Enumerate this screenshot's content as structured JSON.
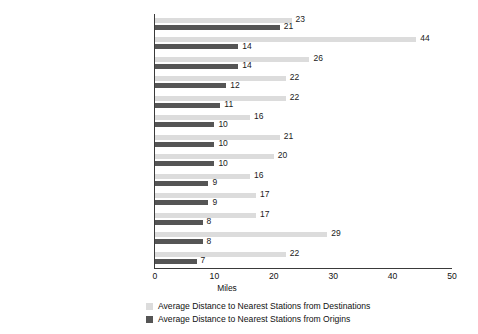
{
  "chart_data": {
    "type": "bar",
    "orientation": "horizontal",
    "title": "",
    "xlabel": "Miles",
    "ylabel": "",
    "xlim": [
      0,
      50
    ],
    "xticks": [
      0,
      10,
      20,
      30,
      40,
      50
    ],
    "grid": false,
    "legend_position": "bottom-left",
    "categories": [
      "Medical",
      "Outdoor recreation",
      "Other",
      "Work",
      "Personal",
      "Drive someone else",
      "Visit Friends & Family",
      "Entertainment",
      "Return home",
      "Business (Work-related)",
      "Combined Business & Pleasure",
      "Vacation/sightseeing",
      "School"
    ],
    "series": [
      {
        "name": "Average Distance to Nearest Stations from Destinations",
        "color": "#dcdcdc",
        "values": [
          23,
          44,
          26,
          22,
          22,
          16,
          21,
          20,
          16,
          17,
          17,
          29,
          22
        ]
      },
      {
        "name": "Average Distance to Nearest Stations from Origins",
        "color": "#555555",
        "values": [
          21,
          14,
          14,
          12,
          11,
          10,
          10,
          10,
          9,
          9,
          8,
          8,
          7
        ]
      }
    ]
  },
  "axis": {
    "x_title": "Miles",
    "tick_labels": [
      "0",
      "10",
      "20",
      "30",
      "40",
      "50"
    ]
  },
  "legend": {
    "items": [
      {
        "label": "Average Distance to Nearest Stations from Destinations",
        "color": "#dcdcdc"
      },
      {
        "label": "Average Distance to Nearest Stations from Origins",
        "color": "#555555"
      }
    ]
  }
}
